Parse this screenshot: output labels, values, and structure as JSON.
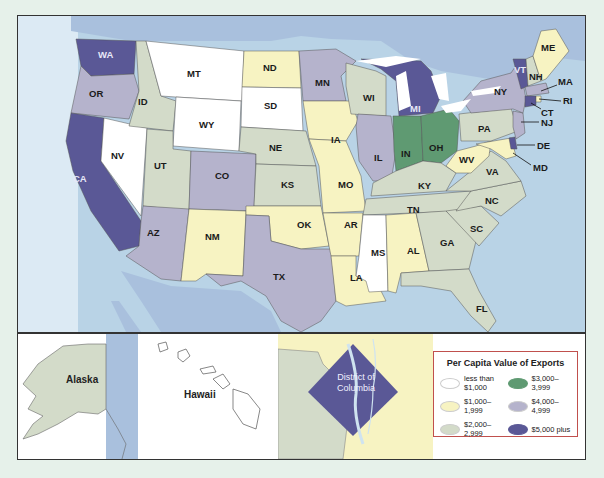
{
  "legend": {
    "title": "Per Capita Value of Exports",
    "items": [
      {
        "label": "less than $1,000",
        "color": "#ffffff"
      },
      {
        "label": "$3,000–3,999",
        "color": "#5f9a72"
      },
      {
        "label": "$1,000–1,999",
        "color": "#f7f3c2"
      },
      {
        "label": "$4,000–4,999",
        "color": "#b5b3cc"
      },
      {
        "label": "$2,000–2,999",
        "color": "#d3dbc9"
      },
      {
        "label": "$5,000 plus",
        "color": "#5a5896"
      }
    ]
  },
  "colors": {
    "water": "#b9d3e6",
    "neighbor_land": "#a9c0dd",
    "under_1000": "#ffffff",
    "r1000_1999": "#f7f3c2",
    "r2000_2999": "#d3dbc9",
    "r3000_3999": "#5f9a72",
    "r4000_4999": "#b5b3cc",
    "r5000_plus": "#5a5896"
  },
  "states": {
    "WA": "WA",
    "OR": "OR",
    "CA": "CA",
    "NV": "NV",
    "ID": "ID",
    "MT": "MT",
    "WY": "WY",
    "UT": "UT",
    "CO": "CO",
    "AZ": "AZ",
    "NM": "NM",
    "ND": "ND",
    "SD": "SD",
    "NE": "NE",
    "KS": "KS",
    "OK": "OK",
    "TX": "TX",
    "MN": "MN",
    "IA": "IA",
    "MO": "MO",
    "AR": "AR",
    "LA": "LA",
    "WI": "WI",
    "IL": "IL",
    "MI": "MI",
    "IN": "IN",
    "OH": "OH",
    "KY": "KY",
    "TN": "TN",
    "MS": "MS",
    "AL": "AL",
    "GA": "GA",
    "FL": "FL",
    "SC": "SC",
    "NC": "NC",
    "VA": "VA",
    "WV": "WV",
    "PA": "PA",
    "NY": "NY",
    "VT": "VT",
    "NH": "NH",
    "ME": "ME",
    "MA": "MA",
    "RI": "RI",
    "CT": "CT",
    "NJ": "NJ",
    "DE": "DE",
    "MD": "MD"
  },
  "insets": {
    "alaska": "Alaska",
    "hawaii": "Hawaii",
    "dc_line1": "District of",
    "dc_line2": "Columbia"
  }
}
